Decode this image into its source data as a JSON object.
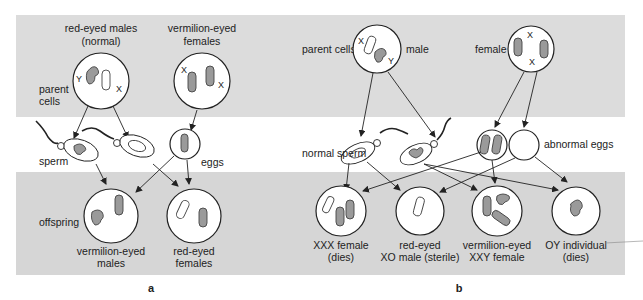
{
  "figure": {
    "colors": {
      "band_gray": "#dcdcdc",
      "band_white": "#ffffff",
      "chromosome_vermilion": "#9a9a9a",
      "line": "#222222"
    },
    "panel_a": {
      "label": "a",
      "parents": {
        "male": {
          "title_line1": "red-eyed males",
          "title_line2": "(normal)",
          "chromosomes": [
            "Y",
            "X"
          ]
        },
        "female": {
          "title_line1": "vermilion-eyed",
          "title_line2": "females",
          "chromosomes": [
            "X",
            "X"
          ]
        }
      },
      "row_labels": {
        "parent_line1": "parent",
        "parent_line2": "cells",
        "sperm": "sperm",
        "eggs": "eggs",
        "offspring": "offspring"
      },
      "offspring": [
        {
          "line1": "vermilion-eyed",
          "line2": "males"
        },
        {
          "line1": "red-eyed",
          "line2": "females"
        }
      ]
    },
    "panel_b": {
      "label": "b",
      "parent_cells_label": "parent cells",
      "male_label": "male",
      "female_label": "female",
      "male_chromosomes": [
        "X",
        "Y"
      ],
      "female_chromosomes": [
        "X",
        "X"
      ],
      "normal_sperm_label": "normal sperm",
      "abnormal_eggs_label": "abnormal eggs",
      "offspring": [
        {
          "line1": "XXX female",
          "line2": "(dies)"
        },
        {
          "line1": "red-eyed",
          "line2": "XO male (sterile)"
        },
        {
          "line1": "vermilion-eyed",
          "line2": "XXY female"
        },
        {
          "line1": "OY individual",
          "line2": "(dies)"
        }
      ]
    },
    "allele_mark": "v"
  }
}
